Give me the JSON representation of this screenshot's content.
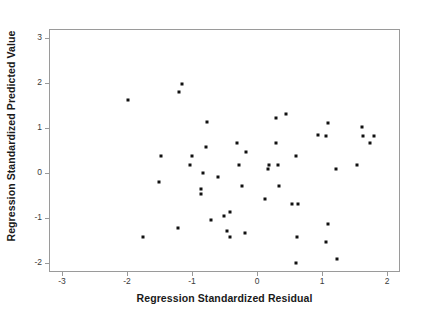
{
  "chart_data": {
    "type": "scatter",
    "title": "",
    "xlabel": "Regression Standardized Residual",
    "ylabel": "Regression Standardized Predicted Value",
    "xlim": [
      -3.2,
      2.2
    ],
    "ylim": [
      -2.2,
      3.2
    ],
    "xticks": [
      -3,
      -2,
      -1,
      0,
      1,
      2
    ],
    "yticks": [
      -2,
      -1,
      0,
      1,
      2,
      3
    ],
    "xtick_labels": [
      "-3",
      "-2",
      "-1",
      "0",
      "1",
      "2"
    ],
    "ytick_labels": [
      "-2",
      "-1",
      "0",
      "1",
      "2",
      "3"
    ],
    "grid": false,
    "legend": null,
    "marker_color": "#111111",
    "frame_color": "#9a9a9a",
    "background_color": "#ffffff",
    "points": [
      [
        -2.0,
        1.65
      ],
      [
        -1.17,
        2.01
      ],
      [
        -1.22,
        1.82
      ],
      [
        -0.78,
        1.15
      ],
      [
        0.28,
        1.24
      ],
      [
        0.43,
        1.33
      ],
      [
        1.07,
        1.14
      ],
      [
        1.6,
        1.04
      ],
      [
        0.93,
        0.86
      ],
      [
        1.05,
        0.85
      ],
      [
        1.62,
        0.85
      ],
      [
        1.78,
        0.85
      ],
      [
        1.72,
        0.68
      ],
      [
        -0.8,
        0.59
      ],
      [
        -0.32,
        0.68
      ],
      [
        0.27,
        0.68
      ],
      [
        -0.18,
        0.49
      ],
      [
        -1.5,
        0.4
      ],
      [
        -1.02,
        0.4
      ],
      [
        -1.05,
        0.2
      ],
      [
        -0.3,
        0.2
      ],
      [
        0.17,
        0.2
      ],
      [
        0.3,
        0.2
      ],
      [
        1.52,
        0.2
      ],
      [
        1.2,
        0.11
      ],
      [
        0.15,
        0.11
      ],
      [
        -0.85,
        0.02
      ],
      [
        -0.62,
        -0.07
      ],
      [
        -1.53,
        -0.17
      ],
      [
        -0.87,
        -0.34
      ],
      [
        -0.88,
        -0.45
      ],
      [
        -0.25,
        -0.27
      ],
      [
        0.32,
        -0.27
      ],
      [
        0.1,
        -0.55
      ],
      [
        0.53,
        -0.66
      ],
      [
        0.62,
        -0.66
      ],
      [
        0.58,
        0.4
      ],
      [
        -0.43,
        -0.85
      ],
      [
        -0.53,
        -0.93
      ],
      [
        -0.73,
        -1.02
      ],
      [
        1.08,
        -1.12
      ],
      [
        -1.23,
        -1.21
      ],
      [
        -0.47,
        -1.27
      ],
      [
        -0.43,
        -1.4
      ],
      [
        -0.2,
        -1.31
      ],
      [
        -1.77,
        -1.4
      ],
      [
        0.6,
        -1.41
      ],
      [
        1.05,
        -1.51
      ],
      [
        1.22,
        -1.89
      ],
      [
        0.58,
        -1.97
      ]
    ]
  },
  "axes": {
    "x_title": "Regression Standardized Residual",
    "y_title": "Regression Standardized Predicted Value"
  }
}
